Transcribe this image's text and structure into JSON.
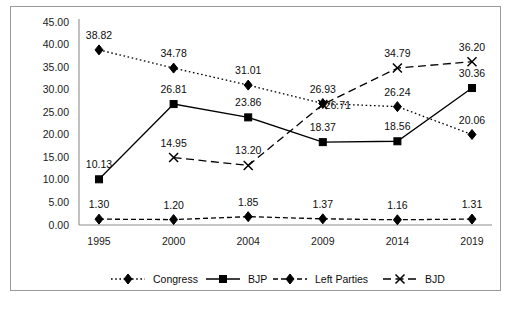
{
  "chart_data": {
    "type": "line",
    "title": "",
    "subtitle": "",
    "xlabel": "",
    "ylabel": "",
    "categories": [
      "1995",
      "2000",
      "2004",
      "2009",
      "2014",
      "2019"
    ],
    "ylim": [
      0,
      45
    ],
    "ytick_step": 5,
    "ytick_labels": [
      "0.00",
      "5.00",
      "10.00",
      "15.00",
      "20.00",
      "25.00",
      "30.00",
      "35.00",
      "40.00",
      "45.00"
    ],
    "grid": false,
    "legend_position": "bottom",
    "data_labels": true,
    "series": [
      {
        "name": "Congress",
        "marker": "diamond",
        "line_style": "dotted",
        "values": [
          38.82,
          34.78,
          31.01,
          26.93,
          26.24,
          20.06
        ],
        "labels": [
          "38.82",
          "34.78",
          "31.01",
          "26.93",
          "26.24",
          "20.06"
        ]
      },
      {
        "name": "BJP",
        "marker": "square",
        "line_style": "solid",
        "values": [
          10.13,
          26.81,
          23.86,
          18.37,
          18.56,
          30.36
        ],
        "labels": [
          "10.13",
          "26.81",
          "23.86",
          "18.37",
          "18.56",
          "30.36"
        ]
      },
      {
        "name": "Left Parties",
        "marker": "diamond",
        "line_style": "dashed",
        "values": [
          1.3,
          1.2,
          1.85,
          1.37,
          1.16,
          1.31
        ],
        "labels": [
          "1.30",
          "1.20",
          "1.85",
          "1.37",
          "1.16",
          "1.31"
        ]
      },
      {
        "name": "BJD",
        "marker": "cross",
        "line_style": "long-dash",
        "values": [
          null,
          14.95,
          13.2,
          26.71,
          34.79,
          36.2
        ],
        "labels": [
          "",
          "14.95",
          "13.20",
          "26.71",
          "34.79",
          "36.20"
        ]
      }
    ],
    "colors": {
      "line": "#000000",
      "marker": "#000000",
      "axis": "#8d8d8d",
      "text": "#0d0d0d",
      "background": "#ffffff",
      "border": "#9a9a9a"
    }
  },
  "legend": {
    "items": [
      {
        "label": "Congress"
      },
      {
        "label": "BJP"
      },
      {
        "label": "Left Parties"
      },
      {
        "label": "BJD"
      }
    ]
  }
}
